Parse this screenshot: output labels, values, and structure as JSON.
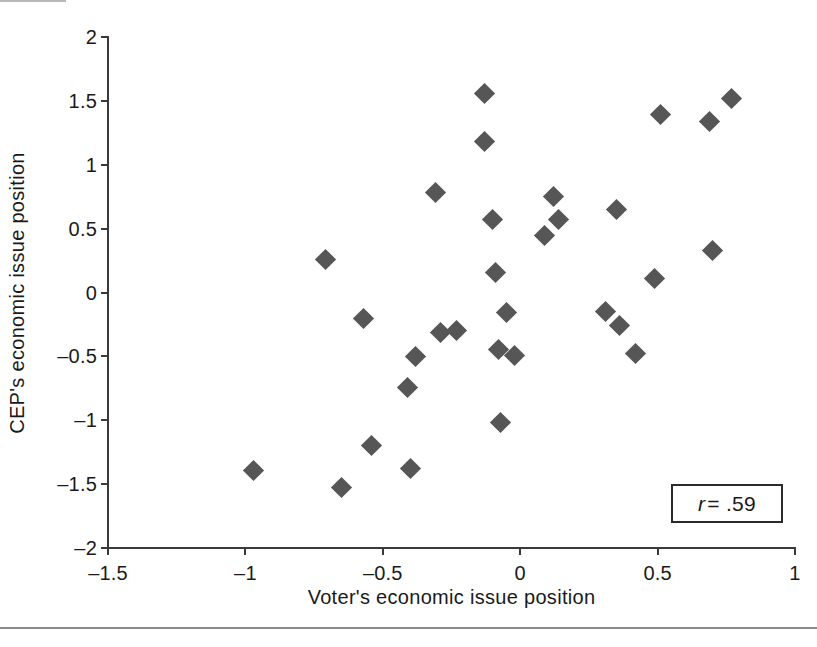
{
  "chart_data": {
    "type": "scatter",
    "title": "",
    "xlabel": "Voter's economic issue position",
    "ylabel": "CEP's economic issue position",
    "xlim": [
      -1.5,
      1
    ],
    "ylim": [
      -2,
      2
    ],
    "xticks": [
      -1.5,
      -1,
      -0.5,
      0,
      0.5,
      1
    ],
    "xticklabels": [
      "–1.5",
      "–1",
      "–0.5",
      "0",
      "0.5",
      "1"
    ],
    "yticks": [
      2,
      1.5,
      1,
      0.5,
      0,
      -0.5,
      -1,
      -1.5,
      -2
    ],
    "yticklabels": [
      "2",
      "1.5",
      "1",
      "0.5",
      "0",
      "–0.5",
      "–1",
      "–1.5",
      "–2"
    ],
    "grid": false,
    "legend": null,
    "marker": "diamond",
    "marker_color": "#565656",
    "annotations": [
      {
        "name": "correlation-box",
        "symbol": "r",
        "text": "= .59",
        "value": 0.59
      }
    ],
    "points": [
      {
        "x": -0.97,
        "y": -1.39
      },
      {
        "x": -0.71,
        "y": 0.26
      },
      {
        "x": -0.65,
        "y": -1.53
      },
      {
        "x": -0.57,
        "y": -0.2
      },
      {
        "x": -0.54,
        "y": -1.2
      },
      {
        "x": -0.41,
        "y": -0.74
      },
      {
        "x": -0.4,
        "y": -1.38
      },
      {
        "x": -0.38,
        "y": -0.5
      },
      {
        "x": -0.31,
        "y": 0.78
      },
      {
        "x": -0.29,
        "y": -0.31
      },
      {
        "x": -0.23,
        "y": -0.3
      },
      {
        "x": -0.13,
        "y": 1.56
      },
      {
        "x": -0.13,
        "y": 1.18
      },
      {
        "x": -0.1,
        "y": 0.57
      },
      {
        "x": -0.09,
        "y": 0.16
      },
      {
        "x": -0.08,
        "y": -0.45
      },
      {
        "x": -0.07,
        "y": -1.02
      },
      {
        "x": -0.05,
        "y": -0.16
      },
      {
        "x": -0.02,
        "y": -0.49
      },
      {
        "x": 0.09,
        "y": 0.45
      },
      {
        "x": 0.12,
        "y": 0.75
      },
      {
        "x": 0.14,
        "y": 0.57
      },
      {
        "x": 0.31,
        "y": -0.15
      },
      {
        "x": 0.35,
        "y": 0.65
      },
      {
        "x": 0.36,
        "y": -0.26
      },
      {
        "x": 0.42,
        "y": -0.48
      },
      {
        "x": 0.49,
        "y": 0.11
      },
      {
        "x": 0.51,
        "y": 1.39
      },
      {
        "x": 0.69,
        "y": 1.34
      },
      {
        "x": 0.7,
        "y": 0.33
      },
      {
        "x": 0.77,
        "y": 1.52
      }
    ]
  }
}
